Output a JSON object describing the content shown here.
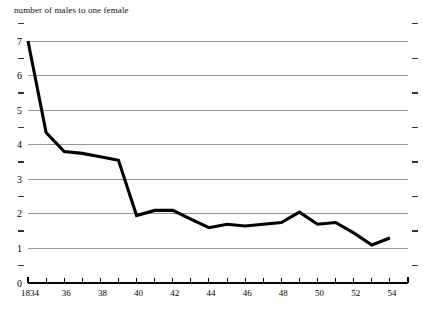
{
  "chart_data": {
    "type": "line",
    "title": "number of males to one female",
    "xlabel": "",
    "ylabel": "",
    "ylim": [
      0,
      7
    ],
    "xlim": [
      1834,
      1855
    ],
    "grid": true,
    "legend": false,
    "y_major_ticks": [
      0,
      1,
      2,
      3,
      4,
      5,
      6,
      7
    ],
    "y_major_labels": [
      "0",
      "1",
      "2",
      "3",
      "4",
      "5",
      "6",
      "7"
    ],
    "y_minor_ticks": [
      0.5,
      1.5,
      2.5,
      3.5,
      4.5,
      5.5,
      6.5,
      7.5
    ],
    "x_tick_values": [
      1834,
      1835,
      1836,
      1837,
      1838,
      1839,
      1840,
      1841,
      1842,
      1843,
      1844,
      1845,
      1846,
      1847,
      1848,
      1849,
      1850,
      1851,
      1852,
      1853,
      1854,
      1855
    ],
    "x_labeled_values": [
      1834,
      1836,
      1838,
      1840,
      1842,
      1844,
      1846,
      1848,
      1850,
      1852,
      1854
    ],
    "x_labels": [
      "1834",
      "36",
      "38",
      "40",
      "42",
      "44",
      "46",
      "48",
      "50",
      "52",
      "54"
    ],
    "x": [
      1834,
      1835,
      1836,
      1837,
      1838,
      1839,
      1840,
      1841,
      1842,
      1843,
      1844,
      1845,
      1846,
      1847,
      1848,
      1849,
      1850,
      1851,
      1852,
      1853,
      1854
    ],
    "values": [
      7.0,
      4.35,
      3.8,
      3.75,
      3.65,
      3.55,
      1.95,
      2.1,
      2.1,
      1.85,
      1.6,
      1.7,
      1.65,
      1.7,
      1.75,
      2.05,
      1.7,
      1.75,
      1.45,
      1.1,
      1.3
    ],
    "series": [
      {
        "name": "number of males to one female",
        "color": "#000000",
        "values": [
          7.0,
          4.35,
          3.8,
          3.75,
          3.65,
          3.55,
          1.95,
          2.1,
          2.1,
          1.85,
          1.6,
          1.7,
          1.65,
          1.7,
          1.75,
          2.05,
          1.7,
          1.75,
          1.45,
          1.1,
          1.3
        ]
      }
    ]
  },
  "colors": {
    "line": "#000000",
    "grid": "#8c8c8c",
    "axis": "#000000",
    "background": "#ffffff"
  }
}
